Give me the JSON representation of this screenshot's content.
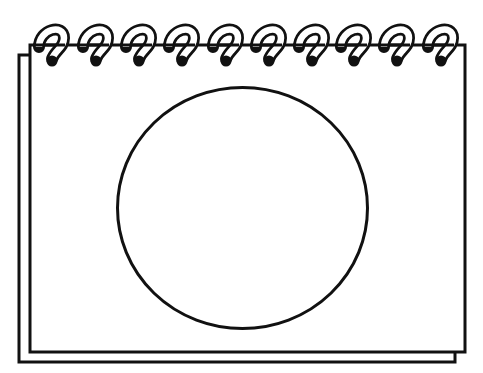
{
  "illustration": {
    "subject": "spiral notepad with blank circle",
    "canvas": {
      "width": 483,
      "height": 373,
      "background": "#ffffff"
    },
    "colors": {
      "ink": "#111111",
      "paper": "#ffffff"
    },
    "back_page": {
      "x": 19,
      "y": 55,
      "width": 436,
      "height": 307
    },
    "front_page": {
      "x": 30,
      "y": 45,
      "width": 435,
      "height": 307
    },
    "circle": {
      "cx": 242.5,
      "cy": 208,
      "rx": 125,
      "ry": 120.5
    },
    "spiral": {
      "ring_count": 10,
      "hole_x": [
        53,
        97,
        140,
        183,
        227,
        270,
        313,
        355,
        398,
        442
      ],
      "hole_y": 61,
      "hole_radius": 4.5
    }
  }
}
